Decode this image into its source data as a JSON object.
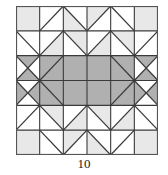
{
  "figure": {
    "caption": "10",
    "grid": {
      "columns": 6,
      "rows": 6
    },
    "colors": {
      "background": "#ffffff",
      "white": "#ffffff",
      "light_gray": "#e8e8e8",
      "dark_gray": "#b0b0b0",
      "line": "#3a3a3a",
      "border": "#555555",
      "caption_text": "#1a1a1a"
    },
    "geometry": {
      "block_left": 16,
      "block_top": 6,
      "block_width": 142,
      "block_height": 149,
      "cell_width": 23.667,
      "cell_height": 24.833
    },
    "cells": [
      [
        {
          "type": "plain",
          "fill": "light_gray"
        },
        {
          "type": "hst",
          "fill_a": "white",
          "fill_b": "white",
          "diag": "tlbr"
        },
        {
          "type": "hst",
          "fill_a": "white",
          "fill_b": "light_gray",
          "diag": "trbl"
        },
        {
          "type": "hst",
          "fill_a": "light_gray",
          "fill_b": "white",
          "diag": "tlbr"
        },
        {
          "type": "hst",
          "fill_a": "white",
          "fill_b": "white",
          "diag": "trbl"
        },
        {
          "type": "plain",
          "fill": "light_gray"
        }
      ],
      [
        {
          "type": "hst",
          "fill_a": "white",
          "fill_b": "white",
          "diag": "trbl"
        },
        {
          "type": "hst",
          "fill_a": "white",
          "fill_b": "light_gray",
          "diag": "tlbr"
        },
        {
          "type": "hst",
          "fill_a": "light_gray",
          "fill_b": "white",
          "diag": "trbl"
        },
        {
          "type": "hst",
          "fill_a": "white",
          "fill_b": "light_gray",
          "diag": "tlbr"
        },
        {
          "type": "hst",
          "fill_a": "light_gray",
          "fill_b": "white",
          "diag": "trbl"
        },
        {
          "type": "hst",
          "fill_a": "white",
          "fill_b": "white",
          "diag": "tlbr"
        }
      ],
      [
        {
          "type": "hourglass",
          "fill_top": "dark_gray",
          "fill_right": "white",
          "fill_bottom": "dark_gray",
          "fill_left": "white"
        },
        {
          "type": "hst",
          "fill_a": "dark_gray",
          "fill_b": "dark_gray",
          "diag": "tlbr"
        },
        {
          "type": "plain",
          "fill": "dark_gray"
        },
        {
          "type": "plain",
          "fill": "dark_gray"
        },
        {
          "type": "hst",
          "fill_a": "dark_gray",
          "fill_b": "dark_gray",
          "diag": "trbl"
        },
        {
          "type": "hourglass",
          "fill_top": "dark_gray",
          "fill_right": "white",
          "fill_bottom": "dark_gray",
          "fill_left": "white"
        }
      ],
      [
        {
          "type": "hourglass",
          "fill_top": "white",
          "fill_right": "dark_gray",
          "fill_bottom": "white",
          "fill_left": "dark_gray"
        },
        {
          "type": "hst",
          "fill_a": "dark_gray",
          "fill_b": "dark_gray",
          "diag": "trbl"
        },
        {
          "type": "plain",
          "fill": "dark_gray"
        },
        {
          "type": "plain",
          "fill": "dark_gray"
        },
        {
          "type": "hst",
          "fill_a": "dark_gray",
          "fill_b": "dark_gray",
          "diag": "tlbr"
        },
        {
          "type": "hourglass",
          "fill_top": "white",
          "fill_right": "dark_gray",
          "fill_bottom": "white",
          "fill_left": "dark_gray"
        }
      ],
      [
        {
          "type": "hst",
          "fill_a": "white",
          "fill_b": "white",
          "diag": "tlbr"
        },
        {
          "type": "hst",
          "fill_a": "light_gray",
          "fill_b": "white",
          "diag": "trbl"
        },
        {
          "type": "hst",
          "fill_a": "white",
          "fill_b": "light_gray",
          "diag": "tlbr"
        },
        {
          "type": "hst",
          "fill_a": "light_gray",
          "fill_b": "white",
          "diag": "trbl"
        },
        {
          "type": "hst",
          "fill_a": "white",
          "fill_b": "light_gray",
          "diag": "tlbr"
        },
        {
          "type": "hst",
          "fill_a": "white",
          "fill_b": "white",
          "diag": "trbl"
        }
      ],
      [
        {
          "type": "plain",
          "fill": "light_gray"
        },
        {
          "type": "hst",
          "fill_a": "white",
          "fill_b": "white",
          "diag": "trbl"
        },
        {
          "type": "hst",
          "fill_a": "light_gray",
          "fill_b": "white",
          "diag": "tlbr"
        },
        {
          "type": "hst",
          "fill_a": "white",
          "fill_b": "light_gray",
          "diag": "trbl"
        },
        {
          "type": "hst",
          "fill_a": "white",
          "fill_b": "white",
          "diag": "tlbr"
        },
        {
          "type": "plain",
          "fill": "light_gray"
        }
      ]
    ]
  }
}
